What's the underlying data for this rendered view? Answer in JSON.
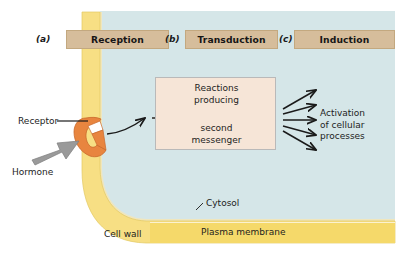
{
  "figure": {
    "colors": {
      "cytosol_blue": "#d5e6e8",
      "cell_wall_yellow": "#f7df84",
      "plasma_membrane_yellow": "#f5d96a",
      "banner_tan": "#d6bd9b",
      "reaction_box_tan": "#f6e5d7",
      "receptor_orange": "#e8853f",
      "hormone_grey": "#9a9a9a",
      "arrow_black": "#1a1a1a",
      "background_white": "#ffffff"
    }
  },
  "stages": [
    {
      "marker": "(a)",
      "label": "Reception"
    },
    {
      "marker": "(b)",
      "label": "Transduction"
    },
    {
      "marker": "(c)",
      "label": "Induction"
    }
  ],
  "reaction_box": {
    "line_top": "Reactions",
    "line_top2": "producing",
    "line_bottom": "second",
    "line_bottom2": "messenger",
    "top_text": "Reactions\nproducing",
    "bottom_text": "second\nmessenger",
    "internal_arrow_count": 3
  },
  "labels": {
    "activation": "Activation\nof cellular\nprocesses",
    "activation_line1": "Activation",
    "activation_line2": "of cellular",
    "activation_line3": "processes",
    "receptor": "Receptor",
    "hormone": "Hormone",
    "cytosol": "Cytosol",
    "cell_wall": "Cell wall",
    "plasma_membrane": "Plasma membrane"
  },
  "structures": {
    "receptor_shape": "receptor-notch",
    "hormone_shape": "hormone-arrow",
    "output_arrow_count": 5,
    "signal_arrow": "curved-arrow-receptor-to-reactions"
  }
}
